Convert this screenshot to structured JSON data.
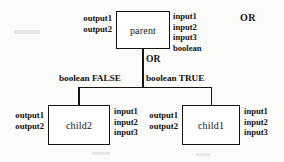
{
  "diagram": {
    "type": "node-tree",
    "root_operator": "OR",
    "corner_operator": "OR",
    "nodes": [
      {
        "id": "parent",
        "label": "parent",
        "outputs": [
          "output1",
          "output2"
        ],
        "inputs": [
          "input1",
          "input2",
          "input3",
          "boolean"
        ]
      },
      {
        "id": "child2",
        "label": "child2",
        "outputs": [
          "output1",
          "output2"
        ],
        "inputs": [
          "input1",
          "input2",
          "input3"
        ]
      },
      {
        "id": "child1",
        "label": "child1",
        "outputs": [
          "output1",
          "output2"
        ],
        "inputs": [
          "input1",
          "input2",
          "input3"
        ]
      }
    ],
    "edges": [
      {
        "from": "parent",
        "to": "child2",
        "label": "boolean FALSE"
      },
      {
        "from": "parent",
        "to": "child1",
        "label": "boolean TRUE"
      }
    ]
  }
}
